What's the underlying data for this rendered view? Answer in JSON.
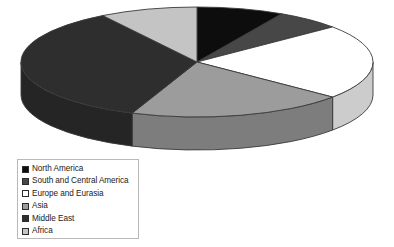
{
  "chart_data": {
    "type": "pie",
    "title": "",
    "legend_position": "bottom-left",
    "three_d": true,
    "categories": [
      "North America",
      "South and Central America",
      "Europe and Eurasia",
      "Asia",
      "Middle East",
      "Africa"
    ],
    "values": [
      8,
      6,
      22,
      20,
      35,
      9
    ],
    "colors": [
      "#0d0d0d",
      "#474747",
      "#ffffff",
      "#9c9c9c",
      "#2e2e2e",
      "#c4c4c4"
    ],
    "start_angle": 0,
    "direction": "clockwise"
  },
  "legend": {
    "items": [
      {
        "label": "North America",
        "color": "#0d0d0d"
      },
      {
        "label": "South and Central America",
        "color": "#474747"
      },
      {
        "label": "Europe and Eurasia",
        "color": "#ffffff"
      },
      {
        "label": "Asia",
        "color": "#9c9c9c"
      },
      {
        "label": "Middle East",
        "color": "#2e2e2e"
      },
      {
        "label": "Africa",
        "color": "#c4c4c4"
      }
    ]
  },
  "style": {
    "background": "#ffffff",
    "outline": "#3a3a3a",
    "legend_border": "#b9b9b9"
  }
}
